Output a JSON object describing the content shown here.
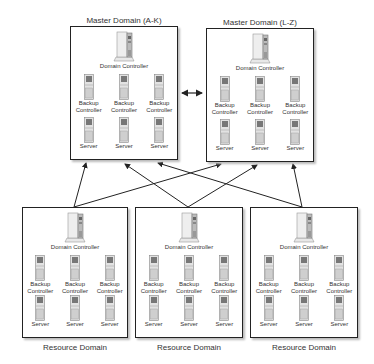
{
  "diagram": {
    "master_domains": [
      {
        "title": "Master Domain (A-K)",
        "domain_controller": "Domain Controller",
        "backup_controllers": [
          "Backup Controller",
          "Backup Controller",
          "Backup Controller"
        ],
        "servers": [
          "Server",
          "Server",
          "Server"
        ]
      },
      {
        "title": "Master Domain (L-Z)",
        "domain_controller": "Domain Controller",
        "backup_controllers": [
          "Backup Controller",
          "Backup Controller",
          "Backup Controller"
        ],
        "servers": [
          "Server",
          "Server",
          "Server"
        ]
      }
    ],
    "resource_domains": [
      {
        "title": "Resource Domain",
        "domain_controller": "Domain Controller",
        "backup_controllers": [
          "Backup Controller",
          "Backup Controller",
          "Backup Controller"
        ],
        "servers": [
          "Server",
          "Server",
          "Server"
        ]
      },
      {
        "title": "Resource Domain",
        "domain_controller": "Domain Controller",
        "backup_controllers": [
          "Backup Controller",
          "Backup Controller",
          "Backup Controller"
        ],
        "servers": [
          "Server",
          "Server",
          "Server"
        ]
      },
      {
        "title": "Resource Domain",
        "domain_controller": "Domain Controller",
        "backup_controllers": [
          "Backup Controller",
          "Backup Controller",
          "Backup Controller"
        ],
        "servers": [
          "Server",
          "Server",
          "Server"
        ]
      }
    ],
    "relationships": [
      {
        "from": "master_domains.0",
        "to": "master_domains.1",
        "type": "two-way trust"
      },
      {
        "from": "resource_domains.0",
        "to": "master_domains.0",
        "type": "one-way trust"
      },
      {
        "from": "resource_domains.0",
        "to": "master_domains.1",
        "type": "one-way trust"
      },
      {
        "from": "resource_domains.1",
        "to": "master_domains.0",
        "type": "one-way trust"
      },
      {
        "from": "resource_domains.1",
        "to": "master_domains.1",
        "type": "one-way trust"
      },
      {
        "from": "resource_domains.2",
        "to": "master_domains.0",
        "type": "one-way trust"
      },
      {
        "from": "resource_domains.2",
        "to": "master_domains.1",
        "type": "one-way trust"
      }
    ]
  }
}
